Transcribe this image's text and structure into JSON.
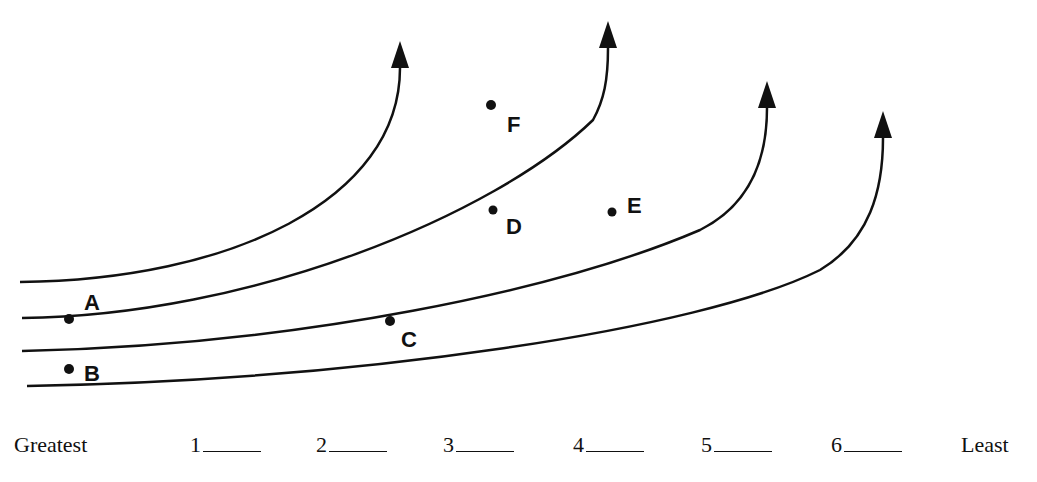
{
  "diagram": {
    "type": "streamlines/isolines with labeled points",
    "points": [
      {
        "label": "A",
        "x": 69,
        "y": 319
      },
      {
        "label": "B",
        "x": 69,
        "y": 369
      },
      {
        "label": "C",
        "x": 390,
        "y": 321
      },
      {
        "label": "D",
        "x": 493,
        "y": 210
      },
      {
        "label": "E",
        "x": 612,
        "y": 212
      },
      {
        "label": "F",
        "x": 491,
        "y": 105
      }
    ],
    "lines": 4,
    "arrow_direction": "up"
  },
  "ranking": {
    "start_label": "Greatest",
    "end_label": "Least",
    "slots": [
      "1",
      "2",
      "3",
      "4",
      "5",
      "6"
    ]
  }
}
